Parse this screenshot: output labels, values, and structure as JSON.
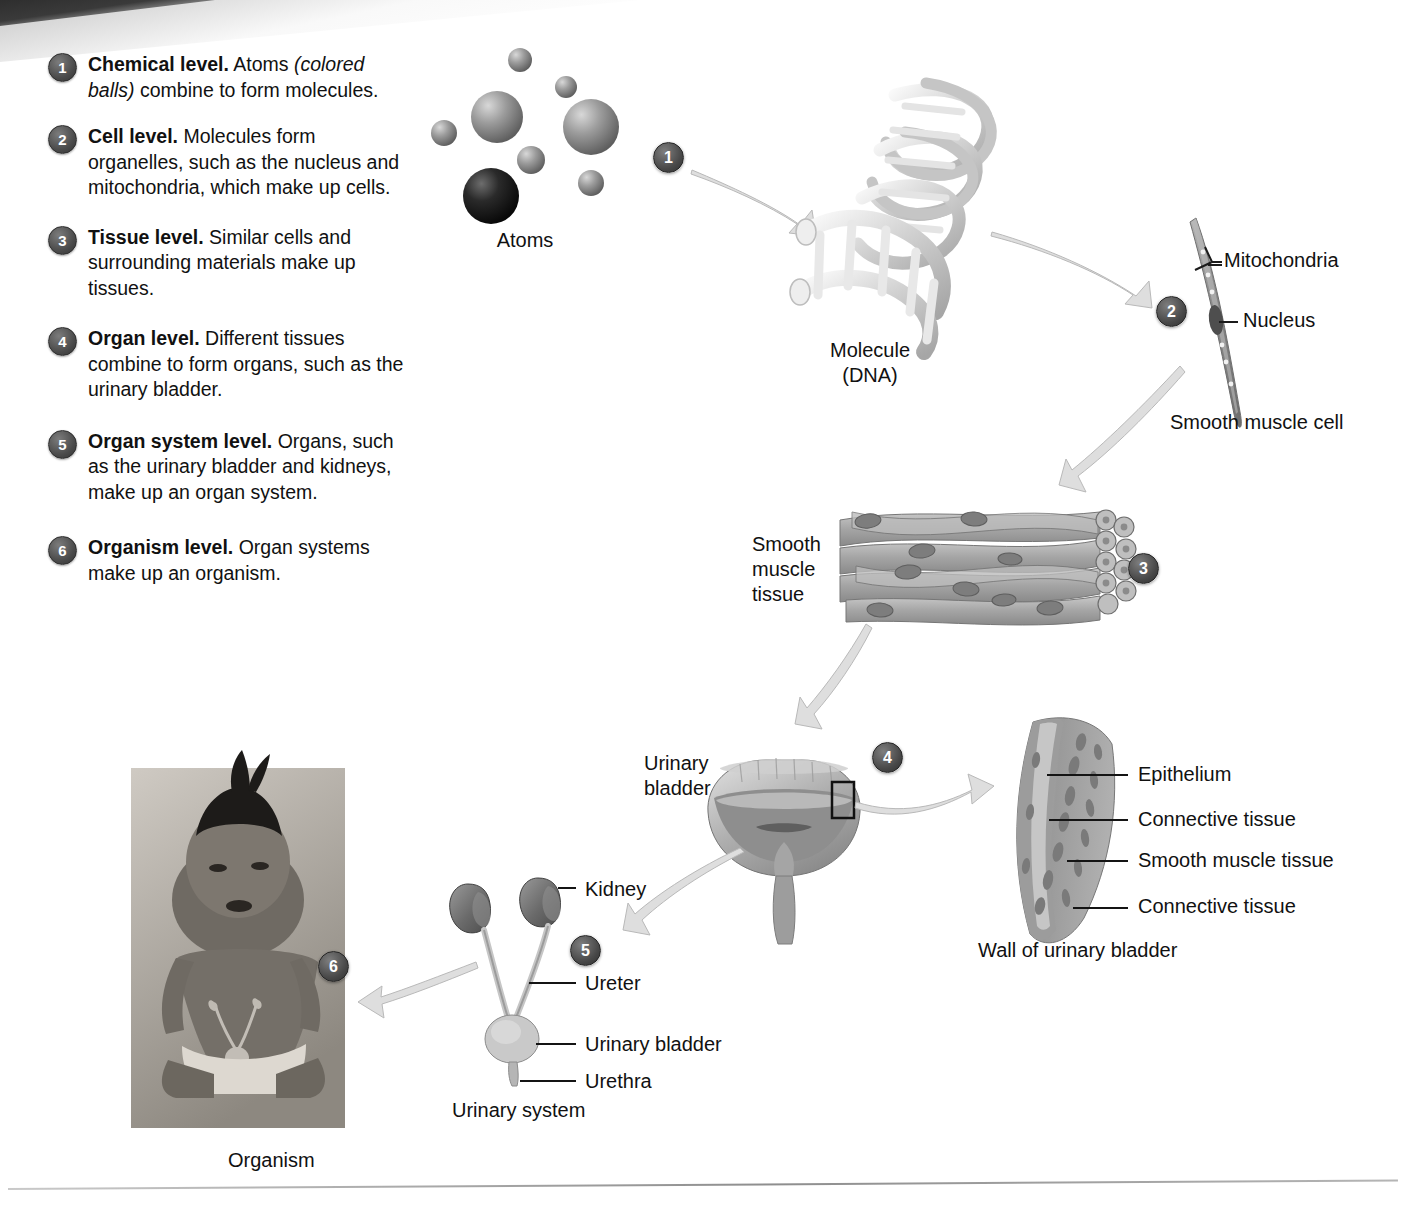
{
  "figure": {
    "accent_dark": "#3c3c3c",
    "arrow_fill": "#dedede"
  },
  "legend": {
    "items": [
      {
        "number": "1",
        "bold": "Chemical level.",
        "rest": " Atoms ",
        "italic": "(colored balls)",
        "tail": " combine to form molecules."
      },
      {
        "number": "2",
        "bold": "Cell level.",
        "rest": " Molecules form organelles, such as the nucleus and mitochondria, which make up cells.",
        "italic": "",
        "tail": ""
      },
      {
        "number": "3",
        "bold": "Tissue level.",
        "rest": " Similar cells and surrounding materials make up tissues.",
        "italic": "",
        "tail": ""
      },
      {
        "number": "4",
        "bold": "Organ level.",
        "rest": " Different tissues combine to form organs, such as the urinary bladder.",
        "italic": "",
        "tail": ""
      },
      {
        "number": "5",
        "bold": "Organ system level.",
        "rest": " Organs, such as the urinary bladder and kidneys, make up an organ system.",
        "italic": "",
        "tail": ""
      },
      {
        "number": "6",
        "bold": "Organism level.",
        "rest": " Organ systems make up an organism.",
        "italic": "",
        "tail": ""
      }
    ]
  },
  "diagram": {
    "step_badges": [
      "1",
      "2",
      "3",
      "4",
      "5",
      "6"
    ],
    "captions": {
      "atoms": "Atoms",
      "molecule": "Molecule\n(DNA)",
      "smooth_muscle_cell": "Smooth muscle cell",
      "smooth_muscle_tissue": "Smooth\nmuscle\ntissue",
      "urinary_bladder": "Urinary\nbladder",
      "wall_of_urinary_bladder": "Wall of urinary bladder",
      "urinary_system": "Urinary system",
      "organism": "Organism"
    },
    "cell_callouts": [
      {
        "label": "Mitochondria"
      },
      {
        "label": "Nucleus"
      }
    ],
    "wall_layers": [
      {
        "label": "Epithelium"
      },
      {
        "label": "Connective tissue"
      },
      {
        "label": "Smooth muscle tissue"
      },
      {
        "label": "Connective tissue"
      }
    ],
    "urinary_parts": [
      {
        "label": "Kidney"
      },
      {
        "label": "Ureter"
      },
      {
        "label": "Urinary bladder"
      },
      {
        "label": "Urethra"
      }
    ]
  }
}
